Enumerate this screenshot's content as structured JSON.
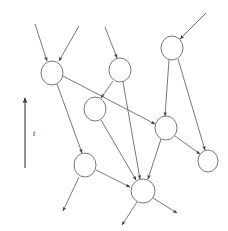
{
  "figure": {
    "background_color": "#ffffff",
    "stroke_color": "#555555",
    "axis_color": "#3a3a3a",
    "width": 228,
    "height": 231
  },
  "axis": {
    "name": "time-axis",
    "label": "t",
    "direction": "up",
    "label_x": 33,
    "label_y": 136,
    "x": 25,
    "y_top": 98,
    "y_bottom": 168
  },
  "chart_data": {
    "type": "diagram",
    "xlabel": "",
    "ylabel": "t",
    "grid": false,
    "legend": "none",
    "nodes": [
      {
        "id": "n1",
        "label": "",
        "cx": 52,
        "cy": 73,
        "rx": 11,
        "ry": 12
      },
      {
        "id": "n2",
        "label": "",
        "cx": 120,
        "cy": 70,
        "rx": 11,
        "ry": 12
      },
      {
        "id": "n3",
        "label": "",
        "cx": 172,
        "cy": 48,
        "rx": 11,
        "ry": 12
      },
      {
        "id": "n4",
        "label": "",
        "cx": 95,
        "cy": 109,
        "rx": 11,
        "ry": 12
      },
      {
        "id": "n5",
        "label": "",
        "cx": 166,
        "cy": 128,
        "rx": 11,
        "ry": 12
      },
      {
        "id": "n6",
        "label": "",
        "cx": 208,
        "cy": 161,
        "rx": 10,
        "ry": 11
      },
      {
        "id": "n7",
        "label": "",
        "cx": 85,
        "cy": 165,
        "rx": 11,
        "ry": 12
      },
      {
        "id": "n8",
        "label": "",
        "cx": 143,
        "cy": 191,
        "rx": 12,
        "ry": 12
      }
    ],
    "external_in": [
      {
        "id": "in1",
        "x1": 35,
        "y1": 24,
        "x2": 47,
        "y2": 61,
        "target": "n1"
      },
      {
        "id": "in2",
        "x1": 79,
        "y1": 26,
        "x2": 59,
        "y2": 61,
        "target": "n1"
      },
      {
        "id": "in3",
        "x1": 105,
        "y1": 27,
        "x2": 117,
        "y2": 58,
        "target": "n2"
      },
      {
        "id": "in4",
        "x1": 206,
        "y1": 13,
        "x2": 180,
        "y2": 39,
        "target": "n3"
      }
    ],
    "internal_edges": [
      {
        "id": "e1",
        "from": "n1",
        "to": "n5",
        "x1": 63,
        "y1": 76,
        "x2": 155,
        "y2": 124
      },
      {
        "id": "e2",
        "from": "n1",
        "to": "n7",
        "x1": 57,
        "y1": 84,
        "x2": 82,
        "y2": 153
      },
      {
        "id": "e3",
        "from": "n2",
        "to": "n4",
        "x1": 113,
        "y1": 81,
        "x2": 101,
        "y2": 98
      },
      {
        "id": "e4",
        "from": "n2",
        "to": "n8",
        "x1": 123,
        "y1": 82,
        "x2": 140,
        "y2": 179
      },
      {
        "id": "e5",
        "from": "n3",
        "to": "n5",
        "x1": 169,
        "y1": 60,
        "x2": 165,
        "y2": 116
      },
      {
        "id": "e6",
        "from": "n3",
        "to": "n6",
        "x1": 178,
        "y1": 59,
        "x2": 205,
        "y2": 150
      },
      {
        "id": "e7",
        "from": "n4",
        "to": "n8",
        "x1": 101,
        "y1": 120,
        "x2": 136,
        "y2": 180
      },
      {
        "id": "e8",
        "from": "n5",
        "to": "n6",
        "x1": 175,
        "y1": 136,
        "x2": 200,
        "y2": 154
      },
      {
        "id": "e9",
        "from": "n5",
        "to": "n8",
        "x1": 161,
        "y1": 139,
        "x2": 148,
        "y2": 179
      },
      {
        "id": "e10",
        "from": "n7",
        "to": "n8",
        "x1": 96,
        "y1": 170,
        "x2": 130,
        "y2": 187
      }
    ],
    "external_out": [
      {
        "id": "out1",
        "source": "n7",
        "x1": 79,
        "y1": 177,
        "x2": 63,
        "y2": 211
      },
      {
        "id": "out2",
        "source": "n8",
        "x1": 137,
        "y1": 202,
        "x2": 122,
        "y2": 225
      },
      {
        "id": "out3",
        "source": "n8",
        "x1": 153,
        "y1": 198,
        "x2": 177,
        "y2": 213
      }
    ],
    "counts": {
      "nodes": 8,
      "incoming_external": 4,
      "internal_edges": 10,
      "outgoing_external": 3
    }
  }
}
